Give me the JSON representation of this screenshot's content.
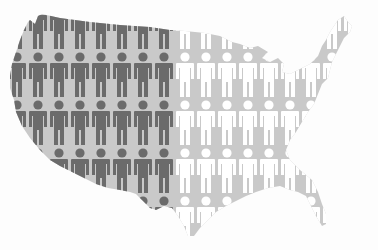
{
  "figure": {
    "background_color": "#fdfdfd",
    "map_color": "#c9c9c9",
    "dark_figure_color": "#6b6b6b",
    "light_figure_color": "#ffffff",
    "grid": {
      "column_x_start": 17,
      "column_spacing": 21,
      "columns": 17,
      "row_head_y": [
        9,
        57,
        105,
        153,
        201
      ],
      "dark_columns": 8
    },
    "icons": [
      "person-icon-dark",
      "person-icon-light"
    ]
  }
}
